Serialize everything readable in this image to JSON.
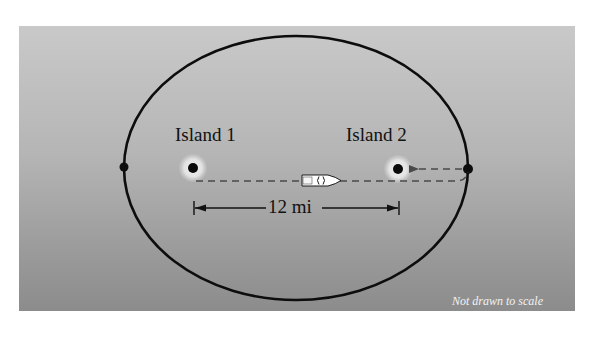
{
  "diagram": {
    "islands": [
      {
        "label": "Island 1",
        "x": 193,
        "y": 168
      },
      {
        "label": "Island 2",
        "x": 398,
        "y": 169
      }
    ],
    "distance_label": "12 mi",
    "scale_note": "Not drawn to scale",
    "ellipse": {
      "cx": 296,
      "cy": 168,
      "rx": 172,
      "ry": 132
    },
    "vertices": [
      {
        "name": "left-vertex",
        "x": 124,
        "y": 167
      },
      {
        "name": "right-vertex",
        "x": 468,
        "y": 169
      }
    ],
    "boat": {
      "x": 320,
      "y": 180,
      "direction": "right"
    },
    "colors": {
      "background_top": "#c9c9c9",
      "background_bottom": "#8c8c8c",
      "ellipse_stroke": "#0d0d0d",
      "dashed_path": "#4a4a4a",
      "island_halo": "#e6e6e6",
      "island_dot": "#0a0a0a",
      "note_text": "#f2f2f2"
    }
  }
}
